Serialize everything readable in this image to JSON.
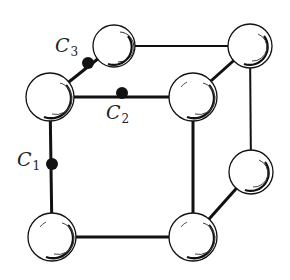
{
  "diagram": {
    "type": "crystal-unit-cell",
    "atoms": [
      {
        "id": "back-top-left",
        "x": 114,
        "y": 46,
        "r": 21
      },
      {
        "id": "back-top-right",
        "x": 250,
        "y": 46,
        "r": 22
      },
      {
        "id": "front-top-left",
        "x": 50,
        "y": 97,
        "r": 24
      },
      {
        "id": "front-top-right",
        "x": 193,
        "y": 97,
        "r": 24
      },
      {
        "id": "back-bottom-right",
        "x": 251,
        "y": 172,
        "r": 22
      },
      {
        "id": "front-bottom-left",
        "x": 52,
        "y": 237,
        "r": 24
      },
      {
        "id": "front-bottom-right",
        "x": 193,
        "y": 237,
        "r": 24
      }
    ],
    "interstitials": [
      {
        "label": "C",
        "subscript": "1",
        "x": 52,
        "y": 164
      },
      {
        "label": "C",
        "subscript": "2",
        "x": 122,
        "y": 93
      },
      {
        "label": "C",
        "subscript": "3",
        "x": 88,
        "y": 63
      }
    ]
  },
  "labels": {
    "c1": {
      "main": "C",
      "sub": "1"
    },
    "c2": {
      "main": "C",
      "sub": "2"
    },
    "c3": {
      "main": "C",
      "sub": "3"
    }
  }
}
